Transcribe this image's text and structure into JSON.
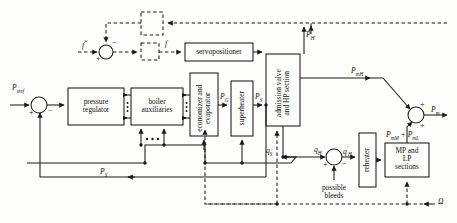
{
  "figure": {
    "type": "block-diagram",
    "width": 457,
    "height": 223,
    "background": "#fdfdfc",
    "line_color": "#1a1a1a"
  },
  "blocks": [
    {
      "id": "pressure-regulator",
      "label": "pressure\nregulator",
      "orientation": "horizontal",
      "style": "solid",
      "x": 68,
      "y": 88,
      "w": 56,
      "h": 37
    },
    {
      "id": "boiler-auxiliaries",
      "label": "boiler\nauxiliaries",
      "orientation": "horizontal",
      "style": "solid",
      "x": 131,
      "y": 88,
      "w": 52,
      "h": 37
    },
    {
      "id": "economizer-evaporator",
      "label": "economizer and\nevaporator",
      "orientation": "vertical",
      "style": "solid",
      "x": 190,
      "y": 73,
      "w": 28,
      "h": 63
    },
    {
      "id": "superheater",
      "label": "superheater",
      "orientation": "vertical",
      "style": "solid",
      "x": 231,
      "y": 81,
      "w": 22,
      "h": 55
    },
    {
      "id": "admission-valve-hp",
      "label": "admission valve\nand HP section",
      "orientation": "vertical",
      "style": "solid",
      "x": 266,
      "y": 54,
      "w": 34,
      "h": 72
    },
    {
      "id": "servopositioner",
      "label": "servopositioner",
      "orientation": "horizontal",
      "style": "solid",
      "x": 185,
      "y": 43,
      "w": 68,
      "h": 18
    },
    {
      "id": "reheater",
      "label": "reheater",
      "orientation": "vertical",
      "style": "solid",
      "x": 359,
      "y": 133,
      "w": 17,
      "h": 54
    },
    {
      "id": "mp-lp-sections",
      "label": "MP and\nLP\nsections",
      "orientation": "horizontal",
      "style": "solid",
      "x": 385,
      "y": 143,
      "w": 44,
      "h": 34
    },
    {
      "id": "dashed-block-upper",
      "label": "",
      "orientation": "horizontal",
      "style": "dashed",
      "x": 141,
      "y": 12,
      "w": 22,
      "h": 23
    },
    {
      "id": "dashed-block-lower",
      "label": "",
      "orientation": "horizontal",
      "style": "dashed",
      "x": 141,
      "y": 43,
      "w": 18,
      "h": 17
    }
  ],
  "summing_junctions": [
    {
      "id": "sum-pressure",
      "x": 39,
      "y": 105,
      "r": 8,
      "signs": [
        {
          "label": "+",
          "pos": "left-bottom"
        },
        {
          "label": "−",
          "pos": "right-bottom"
        }
      ]
    },
    {
      "id": "sum-fuel",
      "x": 106,
      "y": 52,
      "r": 7,
      "signs": [
        {
          "label": "+",
          "pos": "left-bottom"
        },
        {
          "label": "−",
          "pos": "right-top"
        }
      ]
    },
    {
      "id": "sum-bleeds",
      "x": 334,
      "y": 157,
      "r": 8,
      "signs": [
        {
          "label": "+",
          "pos": "left-bottom"
        },
        {
          "label": "−",
          "pos": "right-bottom"
        }
      ]
    },
    {
      "id": "sum-power",
      "x": 416,
      "y": 115,
      "r": 8,
      "signs": [
        {
          "label": "+",
          "pos": "right-top"
        },
        {
          "label": "+",
          "pos": "right-bottom"
        }
      ]
    }
  ],
  "signals": [
    {
      "id": "p-sref",
      "text": "P",
      "sub": "sref",
      "x": 12,
      "y": 86
    },
    {
      "id": "p-s-feedback",
      "text": "P",
      "sub": "S",
      "x": 101,
      "y": 170
    },
    {
      "id": "f-star-input",
      "text": "f",
      "sup": "*",
      "x": 83,
      "y": 41
    },
    {
      "id": "f-command",
      "text": "f",
      "sup": "",
      "x": 165,
      "y": 41
    },
    {
      "id": "p-g",
      "text": "P",
      "sub": "G",
      "x": 221,
      "y": 94
    },
    {
      "id": "p-s-valve",
      "text": "P",
      "sub": "S",
      "x": 257,
      "y": 94
    },
    {
      "id": "p-h",
      "text": "P",
      "sub": "H",
      "x": 306,
      "y": 32
    },
    {
      "id": "p-mh",
      "text": "P",
      "sub": "mH",
      "x": 352,
      "y": 68
    },
    {
      "id": "p-m",
      "text": "P",
      "sub": "m",
      "x": 432,
      "y": 97
    },
    {
      "id": "p-mm-ml",
      "text": "P",
      "sub": "mM",
      "extra": " + P",
      "extra_sub": "mL",
      "x": 389,
      "y": 132
    },
    {
      "id": "q-s",
      "text": "q",
      "sub": "S",
      "x": 267,
      "y": 150
    },
    {
      "id": "q-h",
      "text": "q",
      "sub": "H",
      "x": 315,
      "y": 148
    },
    {
      "id": "q-h-prime",
      "text": "q",
      "sup": "′",
      "sub": "H",
      "x": 344,
      "y": 147
    },
    {
      "id": "omega",
      "text": "Ω",
      "x": 439,
      "y": 201
    }
  ],
  "annotations": [
    {
      "id": "possible-bleeds",
      "label": "possible\nbleeds",
      "x": 312,
      "y": 184
    }
  ]
}
